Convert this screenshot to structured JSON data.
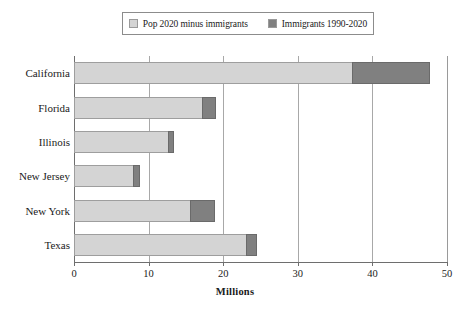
{
  "chart_data": {
    "type": "bar",
    "orientation": "horizontal",
    "stacked": true,
    "title": "",
    "xlabel": "Millions",
    "ylabel": "",
    "xlim": [
      0,
      50
    ],
    "xticks": [
      0,
      10,
      20,
      30,
      40,
      50
    ],
    "xtick_labels": [
      "0",
      "10",
      "20",
      "30",
      "40",
      "50"
    ],
    "grid": true,
    "grid_axis": "x",
    "legend_position": "top-center",
    "categories": [
      "California",
      "Florida",
      "Illinois",
      "New Jersey",
      "New York",
      "Texas"
    ],
    "series": [
      {
        "name": "Pop 2020 minus immigrants",
        "color": "#d4d4d4",
        "values": [
          37.3,
          17.2,
          12.6,
          7.9,
          15.6,
          23.1
        ]
      },
      {
        "name": "Immigrants 1990-2020",
        "color": "#808080",
        "values": [
          10.4,
          1.9,
          0.8,
          0.9,
          3.3,
          1.4
        ]
      }
    ],
    "totals": [
      47.7,
      19.1,
      13.4,
      8.8,
      18.9,
      24.5
    ]
  },
  "legend": {
    "entries": [
      {
        "label": "Pop 2020 minus immigrants",
        "color": "#d4d4d4"
      },
      {
        "label": "Immigrants 1990-2020",
        "color": "#808080"
      }
    ]
  },
  "axis": {
    "x_title": "Millions",
    "x_tick_labels": [
      "0",
      "10",
      "20",
      "30",
      "40",
      "50"
    ],
    "y_tick_labels": [
      "California",
      "Florida",
      "Illinois",
      "New Jersey",
      "New York",
      "Texas"
    ]
  }
}
